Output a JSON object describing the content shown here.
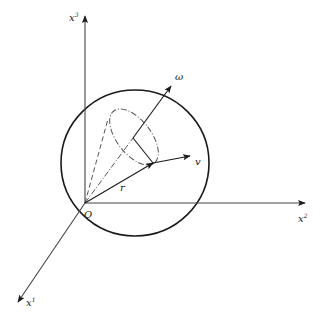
{
  "diagram": {
    "type": "rigid-body rotation in sphere",
    "axes": {
      "x1": {
        "label": "x",
        "sup": "1"
      },
      "x2": {
        "label": "x",
        "sup": "2"
      },
      "x3": {
        "label": "x",
        "sup": "3"
      }
    },
    "origin_label": "O",
    "vectors": {
      "r": {
        "label": "r"
      },
      "v": {
        "label": "v"
      },
      "omega": {
        "label": "ω"
      }
    },
    "colors": {
      "stroke": "#1a1a1a",
      "dashed": "#555555",
      "background": "#ffffff"
    }
  }
}
